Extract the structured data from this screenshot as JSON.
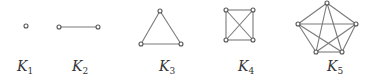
{
  "colors": {
    "edge": "#7a7a7a",
    "node": "#555555",
    "label": "#333333"
  },
  "graphs": [
    {
      "name": "K1",
      "letter": "K",
      "sub": "1",
      "label_x": 17,
      "nodes": [
        [
          26,
          26
        ]
      ],
      "edges": []
    },
    {
      "name": "K2",
      "letter": "K",
      "sub": "2",
      "label_x": 72,
      "nodes": [
        [
          59,
          27
        ],
        [
          98,
          27
        ]
      ],
      "edges": [
        [
          0,
          1
        ]
      ]
    },
    {
      "name": "K3",
      "letter": "K",
      "sub": "3",
      "label_x": 159,
      "nodes": [
        [
          160,
          11
        ],
        [
          141,
          44
        ],
        [
          181,
          44
        ]
      ],
      "edges": [
        [
          0,
          1
        ],
        [
          1,
          2
        ],
        [
          2,
          0
        ]
      ]
    },
    {
      "name": "K4",
      "letter": "K",
      "sub": "4",
      "label_x": 238,
      "nodes": [
        [
          226,
          10
        ],
        [
          253,
          10
        ],
        [
          226,
          40
        ],
        [
          253,
          40
        ]
      ],
      "edges": [
        [
          0,
          1
        ],
        [
          0,
          2
        ],
        [
          0,
          3
        ],
        [
          1,
          2
        ],
        [
          1,
          3
        ],
        [
          2,
          3
        ]
      ]
    },
    {
      "name": "K5",
      "letter": "K",
      "sub": "5",
      "label_x": 327,
      "nodes": [
        [
          327,
          3
        ],
        [
          298,
          24
        ],
        [
          356,
          24
        ],
        [
          316,
          52
        ],
        [
          342,
          52
        ]
      ],
      "edges": [
        [
          0,
          1
        ],
        [
          0,
          2
        ],
        [
          0,
          3
        ],
        [
          0,
          4
        ],
        [
          1,
          2
        ],
        [
          1,
          3
        ],
        [
          1,
          4
        ],
        [
          2,
          3
        ],
        [
          2,
          4
        ],
        [
          3,
          4
        ]
      ]
    }
  ]
}
